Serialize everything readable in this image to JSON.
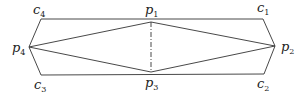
{
  "diagram": {
    "points": {
      "c1": {
        "label": "c",
        "sub": "1",
        "x": 263,
        "y": 19
      },
      "c2": {
        "label": "c",
        "sub": "2",
        "x": 264,
        "y": 74
      },
      "c3": {
        "label": "c",
        "sub": "3",
        "x": 41,
        "y": 75
      },
      "c4": {
        "label": "c",
        "sub": "4",
        "x": 41,
        "y": 19
      },
      "p1": {
        "label": "p",
        "sub": "1",
        "x": 151,
        "y": 22
      },
      "p2": {
        "label": "p",
        "sub": "2",
        "x": 275,
        "y": 46
      },
      "p3": {
        "label": "p",
        "sub": "3",
        "x": 151,
        "y": 72
      },
      "p4": {
        "label": "p",
        "sub": "4",
        "x": 29,
        "y": 47
      }
    },
    "edges_solid": [
      [
        "c4",
        "c1"
      ],
      [
        "c1",
        "p2"
      ],
      [
        "p2",
        "c2"
      ],
      [
        "c2",
        "c3"
      ],
      [
        "c3",
        "p4"
      ],
      [
        "p4",
        "c4"
      ],
      [
        "p4",
        "p1"
      ],
      [
        "p1",
        "p2"
      ],
      [
        "p2",
        "p3"
      ],
      [
        "p3",
        "p4"
      ]
    ],
    "edges_dashed": [
      [
        "p1",
        "p3"
      ]
    ],
    "colors": {
      "line": "#333333",
      "text": "#222222",
      "background": "#ffffff"
    }
  }
}
